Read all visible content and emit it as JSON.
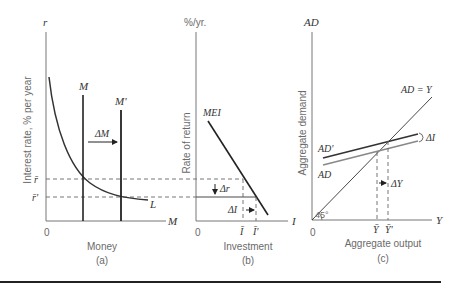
{
  "figure": {
    "panels": [
      {
        "id": "a",
        "caption": "(a)",
        "y_axis_symbol": "r",
        "y_axis_label": "Interest rate, % per year",
        "x_axis_symbol": "M",
        "x_axis_label": "Money",
        "origin": "0",
        "curves": {
          "demand": "L",
          "supply_old": "M",
          "supply_new": "M'"
        },
        "shift_label": "ΔM",
        "levels": {
          "r_bar": "r̄",
          "r_prime": "r̄'"
        }
      },
      {
        "id": "b",
        "caption": "(b)",
        "y_axis_symbol": "%/yr.",
        "y_axis_label": "Rate of return",
        "x_axis_symbol": "I",
        "x_axis_label": "Investment",
        "origin": "0",
        "curves": {
          "mei": "MEI"
        },
        "delta_r": "Δr",
        "delta_i": "ΔI",
        "levels": {
          "i_bar": "Ī",
          "i_prime": "Ī'"
        }
      },
      {
        "id": "c",
        "caption": "(c)",
        "y_axis_symbol": "AD",
        "y_axis_label": "Aggregate demand",
        "x_axis_symbol": "Y",
        "x_axis_label": "Aggregate output",
        "origin": "0",
        "curves": {
          "equality": "AD = Y",
          "ad_new": "AD'",
          "ad_old": "AD"
        },
        "angle": "45°",
        "delta_i": "ΔI",
        "delta_y": "ΔY",
        "levels": {
          "y_bar": "Ȳ",
          "y_prime": "Ȳ'"
        }
      }
    ]
  }
}
